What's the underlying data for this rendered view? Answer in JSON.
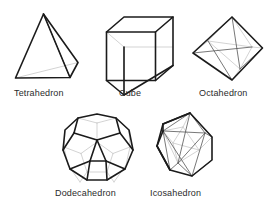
{
  "figure": {
    "background_color": "#ffffff",
    "visible_edge_color": "#1b1b1b",
    "hidden_edge_color": "#c8c8c8",
    "interior_edge_color": "#555555",
    "label_color": "#2b2b2b"
  },
  "solids": [
    {
      "id": "tetrahedron",
      "label": "Tetrahedron",
      "faces": 4,
      "label_x": 14,
      "label_y": 92,
      "row": 1,
      "column": 1
    },
    {
      "id": "cube",
      "label": "Cube",
      "faces": 6,
      "label_x": 119,
      "label_y": 92,
      "row": 1,
      "column": 2
    },
    {
      "id": "octahedron",
      "label": "Octahedron",
      "faces": 8,
      "label_x": 199,
      "label_y": 92,
      "row": 1,
      "column": 3
    },
    {
      "id": "dodecahedron",
      "label": "Dodecahedron",
      "faces": 12,
      "label_x": 55,
      "label_y": 192,
      "row": 2,
      "column": 1
    },
    {
      "id": "icosahedron",
      "label": "Icosahedron",
      "faces": 20,
      "label_x": 150,
      "label_y": 192,
      "row": 2,
      "column": 2
    }
  ]
}
